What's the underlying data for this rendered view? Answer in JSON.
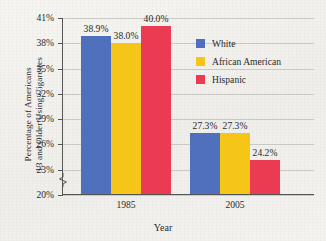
{
  "chart_data": {
    "type": "bar",
    "title": "",
    "xlabel": "Year",
    "ylabel": "Percentage of Americans 13 and Older Using Cigarettes",
    "ylabel_lines": [
      "Percentage of Americans",
      "13 and Older Using Cigarettes"
    ],
    "categories": [
      "1985",
      "2005"
    ],
    "series": [
      {
        "name": "White",
        "color": "#4e70bd",
        "values": [
          38.9,
          27.3
        ],
        "value_labels": [
          "38.9%",
          "27.3%"
        ]
      },
      {
        "name": "African American",
        "color": "#f5c518",
        "values": [
          38.0,
          27.3
        ],
        "value_labels": [
          "38.0%",
          "27.3%"
        ]
      },
      {
        "name": "Hispanic",
        "color": "#ea3b52",
        "values": [
          40.0,
          24.2
        ],
        "value_labels": [
          "40.0%",
          "24.2%"
        ]
      }
    ],
    "ylim": [
      20,
      41
    ],
    "ytick_values": [
      20,
      23,
      26,
      29,
      32,
      35,
      38,
      41
    ],
    "ytick_labels": [
      "20%",
      "23%",
      "26%",
      "29%",
      "32%",
      "35%",
      "38%",
      "41%"
    ],
    "grid": true,
    "axis_break": true,
    "legend_position": "upper right",
    "legend": [
      {
        "label": "White",
        "color": "#4e70bd"
      },
      {
        "label": "African American",
        "color": "#f5c518"
      },
      {
        "label": "Hispanic",
        "color": "#ea3b52"
      }
    ]
  },
  "colors": {
    "background": "#f2f2ee",
    "gridline": "#c9c9c4",
    "axis": "#555555",
    "text": "#2b2b2b",
    "series_white": "#4e70bd",
    "series_african_american": "#f5c518",
    "series_hispanic": "#ea3b52"
  }
}
